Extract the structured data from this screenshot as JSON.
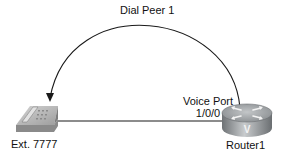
{
  "diagram": {
    "dial_peer": {
      "label": "Dial Peer 1"
    },
    "voice_port": {
      "line1": "Voice Port",
      "line2": "1/0/0"
    },
    "phone": {
      "label": "Ext. 7777"
    },
    "router": {
      "label": "Router1",
      "badge": "V"
    }
  },
  "colors": {
    "line": "#1a1a1a",
    "phone_body": "#b9b9b9",
    "router_body": "#8f9396",
    "router_top": "#a9adb0"
  }
}
